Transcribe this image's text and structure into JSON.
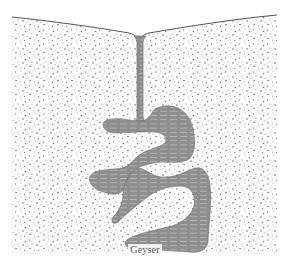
{
  "figure": {
    "type": "cross-section diagram",
    "label": "Geyser",
    "elements": [
      {
        "name": "ground-surface",
        "description": "wavy ground surface line dipping toward central vent"
      },
      {
        "name": "ground-rock",
        "description": "stippled porous rock"
      },
      {
        "name": "vent-conduit",
        "description": "narrow vertical water-filled channel from surface down to chambers"
      },
      {
        "name": "water-chambers",
        "description": "interconnected irregular underground chambers filled with water"
      }
    ]
  },
  "colors": {
    "background": "#ffffff",
    "ground_stipple": "#8a8a8a",
    "ground_fill": "#f7f7f7",
    "water_fill": "#8e8e8e",
    "water_hatch": "#b4b4b4",
    "outline": "#555555",
    "label": "#555555"
  }
}
